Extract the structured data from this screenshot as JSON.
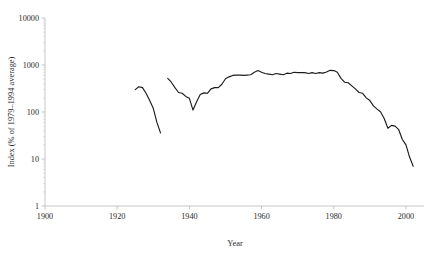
{
  "chart_data": {
    "type": "line",
    "title": "",
    "xlabel": "Year",
    "ylabel": "Index (% of 1979–1994 average)",
    "xlim": [
      1900,
      2005
    ],
    "ylim": [
      1,
      10000
    ],
    "yscale": "log",
    "grid": false,
    "legend": "none",
    "xticks": [
      1900,
      1920,
      1940,
      1960,
      1980,
      2000
    ],
    "xtick_labels": [
      "1900",
      "1920",
      "1940",
      "1960",
      "1980",
      "2000"
    ],
    "yticks": [
      1,
      10,
      100,
      1000,
      10000
    ],
    "ytick_labels": [
      "1",
      "10",
      "100",
      "1000",
      "10000"
    ],
    "series": [
      {
        "name": "segment-1",
        "x": [
          1925,
          1926,
          1927,
          1928,
          1929,
          1930,
          1931,
          1932
        ],
        "values": [
          300,
          345,
          330,
          250,
          175,
          120,
          60,
          36
        ]
      },
      {
        "name": "segment-2",
        "x": [
          1934,
          1935,
          1936,
          1937,
          1938,
          1939,
          1940,
          1941,
          1942,
          1943,
          1944,
          1945,
          1946,
          1947,
          1948,
          1949,
          1950,
          1951,
          1952,
          1953,
          1954,
          1955,
          1956,
          1957,
          1958,
          1959,
          1960,
          1961,
          1962,
          1963,
          1964,
          1965,
          1966,
          1967,
          1968,
          1969,
          1970,
          1971,
          1972,
          1973,
          1974,
          1975,
          1976,
          1977,
          1978,
          1979,
          1980,
          1981,
          1982,
          1983,
          1984,
          1985,
          1986,
          1987,
          1988,
          1989,
          1990,
          1991,
          1992,
          1993,
          1994,
          1995,
          1996,
          1997,
          1998,
          1999,
          2000,
          2001,
          2002
        ],
        "values": [
          520,
          430,
          330,
          260,
          250,
          215,
          195,
          110,
          165,
          235,
          255,
          250,
          310,
          330,
          330,
          390,
          510,
          560,
          600,
          610,
          610,
          600,
          610,
          620,
          700,
          760,
          700,
          660,
          640,
          620,
          660,
          640,
          620,
          670,
          660,
          700,
          690,
          690,
          690,
          660,
          690,
          660,
          690,
          670,
          710,
          770,
          760,
          700,
          520,
          430,
          420,
          360,
          310,
          260,
          250,
          200,
          175,
          135,
          115,
          100,
          72,
          45,
          52,
          50,
          42,
          26,
          20,
          11,
          7
        ]
      }
    ]
  }
}
